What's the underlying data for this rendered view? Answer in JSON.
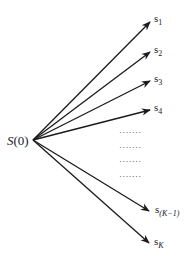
{
  "diagram": {
    "source_label": "S(0)",
    "source_label_parts": {
      "main": "S",
      "paren": "(0)"
    },
    "targets": [
      {
        "id": "s1",
        "base": "s",
        "sub": "1"
      },
      {
        "id": "s2",
        "base": "s",
        "sub": "2"
      },
      {
        "id": "s3",
        "base": "s",
        "sub": "3"
      },
      {
        "id": "s4",
        "base": "s",
        "sub": "4"
      },
      {
        "id": "sK-1",
        "base": "s",
        "sub": "(K−1)"
      },
      {
        "id": "sK",
        "base": "s",
        "sub": "K"
      }
    ],
    "ellipsis_rows": [
      "·······",
      "·······",
      "·······",
      "·······"
    ],
    "colors": {
      "line": "#1a1a1a",
      "text": "#222222",
      "background": "#ffffff"
    }
  }
}
